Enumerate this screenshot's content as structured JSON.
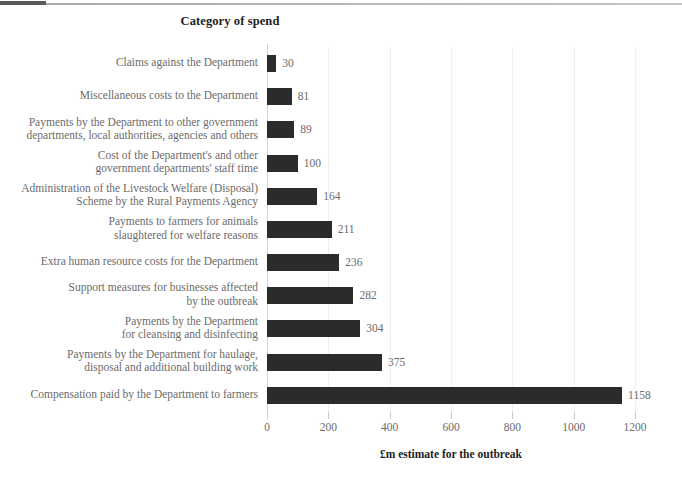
{
  "chart_data": {
    "type": "bar",
    "orientation": "horizontal",
    "title": "Category of spend",
    "xlabel": "£m estimate for the outbreak",
    "ylabel": "Category of spend",
    "xlim": [
      0,
      1200
    ],
    "xticks": [
      0,
      200,
      400,
      600,
      800,
      1000,
      1200
    ],
    "grid": true,
    "legend": null,
    "bar_color": "#2b2b2b",
    "categories": [
      "Claims against the Department",
      "Miscellaneous costs to the Department",
      "Payments by the Department to other government\ndepartments, local authorities, agencies and others",
      "Cost of the Department's and other\ngovernment departments' staff time",
      "Administration of the Livestock Welfare (Disposal)\nScheme by the Rural Payments Agency",
      "Payments to farmers for animals\nslaughtered for welfare reasons",
      "Extra human resource costs for the Department",
      "Support measures for businesses affected\nby the outbreak",
      "Payments by the Department\nfor cleansing and disinfecting",
      "Payments by the Department for haulage,\ndisposal and additional building work",
      "Compensation paid by the Department to farmers"
    ],
    "values": [
      30,
      81,
      89,
      100,
      164,
      211,
      236,
      282,
      304,
      375,
      1158
    ],
    "value_labels": [
      "30",
      "81",
      "89",
      "100",
      "164",
      "211",
      "236",
      "282",
      "304",
      "375",
      "1158"
    ],
    "tick_labels": [
      "0",
      "200",
      "400",
      "600",
      "800",
      "1000",
      "1200"
    ]
  }
}
